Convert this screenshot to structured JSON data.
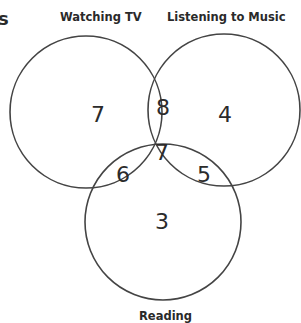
{
  "diagram": {
    "type": "venn-3",
    "cut_off_text": "s",
    "sets": [
      {
        "name": "Watching TV",
        "only": "7"
      },
      {
        "name": "Listening to Music",
        "only": "4"
      },
      {
        "name": "Reading",
        "only": "3"
      }
    ],
    "regions": {
      "tv_only": "7",
      "music_only": "4",
      "reading_only": "3",
      "tv_music": "8",
      "tv_reading": "6",
      "music_reading": "5",
      "all_three": "7"
    },
    "labels": {
      "tv": "Watching TV",
      "music": "Listening to Music",
      "reading": "Reading"
    },
    "stroke_color": "#444444"
  }
}
